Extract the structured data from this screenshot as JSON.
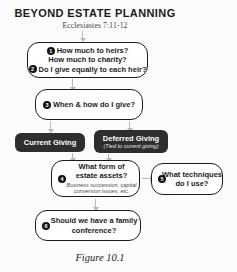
{
  "page": {
    "title": "BEYOND ESTATE PLANNING",
    "subtitle": "Ecclesiastes 7:11-12",
    "caption": "Figure 10.1"
  },
  "flowchart": {
    "heirs_box": {
      "num1": "1",
      "line1": "How much to heirs?",
      "line2": "How much to charity?",
      "num2": "2",
      "line3": "Do I give equally to each heir?"
    },
    "when_box": {
      "num": "3",
      "label": "When & how do I give?"
    },
    "current_box": {
      "label": "Current Giving"
    },
    "deferred_box": {
      "label": "Deferred Giving",
      "sub": "(Tied to current giving)"
    },
    "assets_box": {
      "num": "4",
      "line1": "What form of",
      "line2": "estate assets?",
      "sub": "Business succession, capital conversion issues, etc."
    },
    "techniques_box": {
      "num": "5",
      "line1": "What techniques",
      "line2": "do I use?"
    },
    "conference_box": {
      "num": "6",
      "line1": "Should we have a family",
      "line2": "conference?"
    }
  },
  "colors": {
    "dark_box": "#2e2e2e",
    "box_border": "#1c1c1c",
    "arrow": "#b9b9b9"
  }
}
